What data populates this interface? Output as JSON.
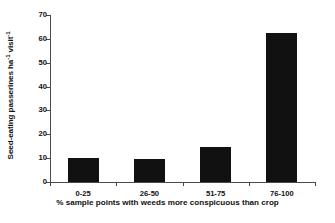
{
  "chart_data": {
    "type": "bar",
    "title": "",
    "categories": [
      "0-25",
      "26-50",
      "51-75",
      "76-100"
    ],
    "values": [
      10.0,
      9.8,
      14.7,
      62.3
    ],
    "xlabel": "% sample points with weeds more conspicuous than crop",
    "ylabel_parts": {
      "main_a": "Seed-eating passerines ha",
      "sup_a": "-1",
      "main_b": " visit",
      "sup_b": "-1"
    },
    "ylabel_plain": "Seed-eating passerines ha-1 visit-1",
    "ylim": [
      0,
      70
    ],
    "yticks": [
      0,
      10,
      20,
      30,
      40,
      50,
      60,
      70
    ],
    "ytick_labels": [
      "0",
      "10",
      "20",
      "30",
      "40",
      "50",
      "60",
      "70"
    ],
    "grid": false,
    "legend": "none",
    "bar_color": "#111111",
    "axis_color": "#4a4a4a"
  }
}
